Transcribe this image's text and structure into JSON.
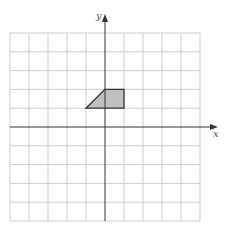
{
  "diagram": {
    "type": "coordinate-grid",
    "grid": {
      "columns": 10,
      "rows": 10,
      "x_range": [
        -5,
        5
      ],
      "y_range": [
        -5,
        5
      ],
      "line_color": "#c8c8c8"
    },
    "axes": {
      "x_label": "x",
      "y_label": "y",
      "color": "#333333"
    },
    "shape": {
      "name": "trapezoid",
      "vertices": [
        [
          -1,
          1
        ],
        [
          1,
          1
        ],
        [
          1,
          2
        ],
        [
          0,
          2
        ]
      ],
      "fill": "#c0c0c0",
      "stroke": "#333333"
    }
  }
}
